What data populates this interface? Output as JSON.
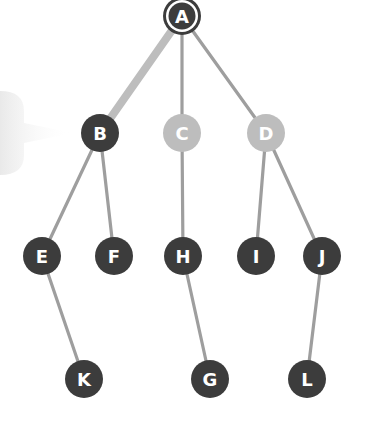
{
  "diagram": {
    "type": "tree",
    "colors": {
      "node_dark": "#3c3c3c",
      "node_faded": "#bdbdbd",
      "edge": "#9e9e9e",
      "edge_highlight": "#bdbdbd",
      "label": "#ffffff",
      "pointer": "#ededed"
    },
    "nodes": [
      {
        "id": "A",
        "label": "A",
        "x": 182,
        "y": 16,
        "style": "root"
      },
      {
        "id": "B",
        "label": "B",
        "x": 100,
        "y": 133,
        "style": "dark"
      },
      {
        "id": "C",
        "label": "C",
        "x": 182,
        "y": 133,
        "style": "faded"
      },
      {
        "id": "D",
        "label": "D",
        "x": 266,
        "y": 133,
        "style": "faded"
      },
      {
        "id": "E",
        "label": "E",
        "x": 42,
        "y": 256,
        "style": "dark"
      },
      {
        "id": "F",
        "label": "F",
        "x": 114,
        "y": 256,
        "style": "dark"
      },
      {
        "id": "H",
        "label": "H",
        "x": 183,
        "y": 256,
        "style": "dark"
      },
      {
        "id": "I",
        "label": "I",
        "x": 256,
        "y": 256,
        "style": "dark"
      },
      {
        "id": "J",
        "label": "J",
        "x": 322,
        "y": 256,
        "style": "dark"
      },
      {
        "id": "K",
        "label": "K",
        "x": 84,
        "y": 379,
        "style": "dark"
      },
      {
        "id": "G",
        "label": "G",
        "x": 210,
        "y": 379,
        "style": "dark"
      },
      {
        "id": "L",
        "label": "L",
        "x": 307,
        "y": 379,
        "style": "dark"
      }
    ],
    "edges": [
      {
        "from": "A",
        "to": "B",
        "highlight": true
      },
      {
        "from": "A",
        "to": "C",
        "highlight": false
      },
      {
        "from": "A",
        "to": "D",
        "highlight": false
      },
      {
        "from": "B",
        "to": "E",
        "highlight": false
      },
      {
        "from": "B",
        "to": "F",
        "highlight": false
      },
      {
        "from": "C",
        "to": "H",
        "highlight": false
      },
      {
        "from": "D",
        "to": "I",
        "highlight": false
      },
      {
        "from": "D",
        "to": "J",
        "highlight": false
      },
      {
        "from": "E",
        "to": "K",
        "highlight": false
      },
      {
        "from": "H",
        "to": "G",
        "highlight": false
      },
      {
        "from": "J",
        "to": "L",
        "highlight": false
      }
    ],
    "pointer": {
      "target": "B"
    }
  }
}
